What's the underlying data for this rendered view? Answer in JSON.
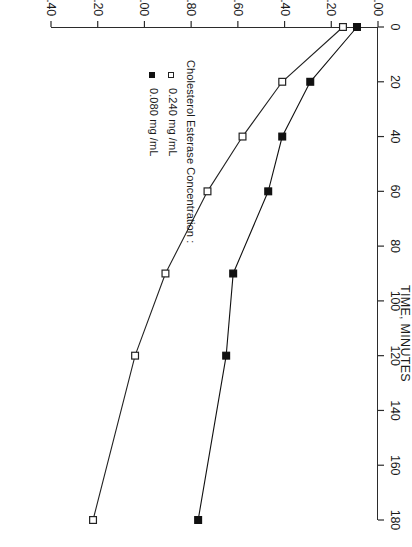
{
  "chart_data": {
    "type": "line",
    "title": "",
    "xlabel": "TIME, MINUTES",
    "ylabel": "ADSORPTION, ug/cm^2",
    "xlim": [
      0,
      180
    ],
    "ylim": [
      0.0,
      1.4
    ],
    "xticks": [
      0,
      20,
      40,
      60,
      80,
      100,
      120,
      140,
      160,
      180
    ],
    "xtick_labels": [
      "0",
      "20",
      "40",
      "60",
      "80",
      "100",
      "120",
      "140",
      "160",
      "180"
    ],
    "yticks": [
      0.0,
      0.2,
      0.4,
      0.6,
      0.8,
      1.0,
      1.2,
      1.4
    ],
    "ytick_labels": [
      "0.00",
      "0.20",
      "0.40",
      "0.60",
      "0.80",
      "1.00",
      "1.20",
      "1.40"
    ],
    "grid": false,
    "legend_position": "inside-left",
    "legend_title": "Cholesterol  Esterase  Concentration :",
    "x": [
      0,
      20,
      40,
      60,
      90,
      120,
      180
    ],
    "series": [
      {
        "name": "0.240  mg /mL",
        "marker": "open-square",
        "color": "#222222",
        "values": [
          0.15,
          0.41,
          0.58,
          0.73,
          0.91,
          1.04,
          1.22
        ]
      },
      {
        "name": "0.080  mg /mL",
        "marker": "filled-square",
        "color": "#111111",
        "values": [
          0.09,
          0.29,
          0.41,
          0.47,
          0.62,
          0.65,
          0.77
        ]
      }
    ]
  },
  "axes": {
    "x_title": "TIME, MINUTES",
    "y_title": "ADSORPTION, ug/cm^2"
  },
  "legend": {
    "title": "Cholesterol  Esterase  Concentration :",
    "entries": [
      {
        "label": "0.240  mg /mL",
        "marker": "open-square"
      },
      {
        "label": "0.080  mg /mL",
        "marker": "filled-square"
      }
    ]
  }
}
